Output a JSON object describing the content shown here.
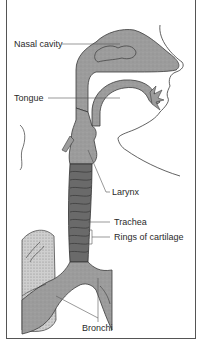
{
  "diagram": {
    "title": "",
    "colors": {
      "frame": "#555555",
      "airway_fill": "#9a9a9a",
      "trachea_fill": "#666666",
      "lung_fill": "#c8c8c8",
      "outline": "#3a3a3a",
      "leader_line": "#555555",
      "text": "#2a2a2a"
    },
    "labels": [
      {
        "id": "nasal-cavity",
        "text": "Nasal cavity"
      },
      {
        "id": "tongue",
        "text": "Tongue"
      },
      {
        "id": "larynx",
        "text": "Larynx"
      },
      {
        "id": "trachea",
        "text": "Trachea"
      },
      {
        "id": "rings-of-cartilage",
        "text": "Rings of cartilage"
      },
      {
        "id": "bronchi",
        "text": "Bronchi"
      }
    ]
  }
}
